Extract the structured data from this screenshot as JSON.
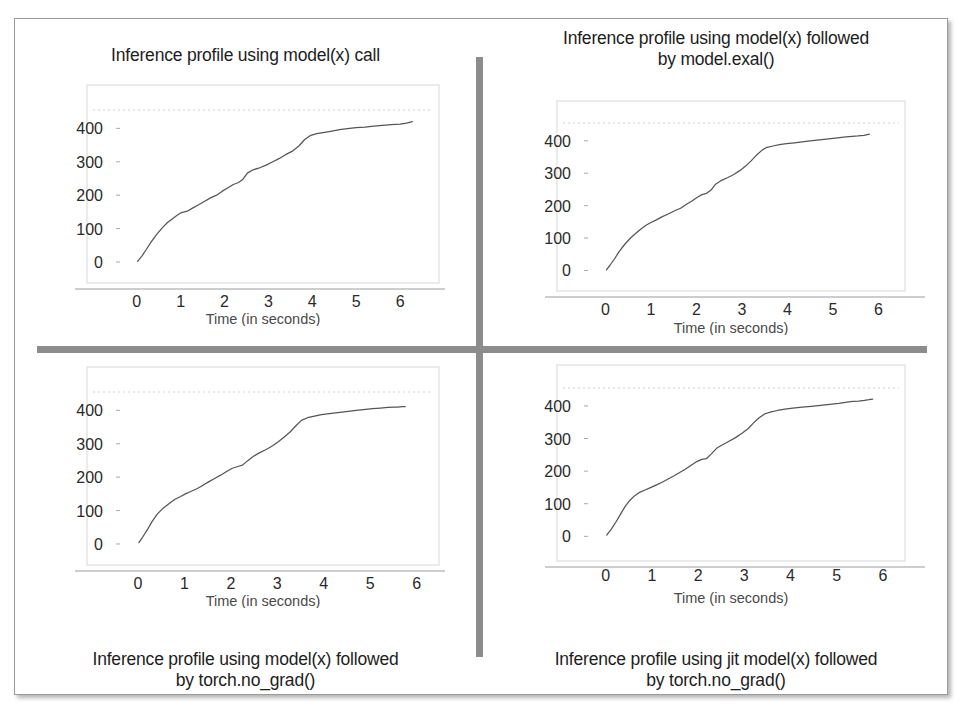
{
  "figure": {
    "layout": "2x2 grid of line charts separated by gray divider bars",
    "divider_color": "#8c8c8c",
    "frame_border_color": "#9a9a9a",
    "background_color": "#ffffff"
  },
  "charts": [
    {
      "position": "top-left",
      "title": "Inference profile using model(x) call",
      "title_position": "above",
      "chart_data": {
        "type": "line",
        "title": "Inference profile using model(x) call",
        "xlabel": "Time (in seconds)",
        "ylabel": "",
        "xlim": [
          -0.45,
          6.75
        ],
        "ylim": [
          -45,
          455
        ],
        "xticks": [
          0,
          1,
          2,
          3,
          4,
          5,
          6
        ],
        "yticks": [
          0,
          100,
          200,
          300,
          400
        ],
        "grid": false,
        "dotted_reference_line_y": 412,
        "legend": "none",
        "x": [
          0.02,
          0.12,
          0.22,
          0.33,
          0.45,
          0.58,
          0.7,
          0.8,
          0.92,
          1.02,
          1.15,
          1.28,
          1.42,
          1.55,
          1.68,
          1.82,
          1.95,
          2.08,
          2.2,
          2.32,
          2.42,
          2.52,
          2.65,
          2.8,
          2.95,
          3.1,
          3.25,
          3.4,
          3.55,
          3.7,
          3.82,
          3.95,
          4.1,
          4.28,
          4.45,
          4.62,
          4.8,
          5.0,
          5.2,
          5.4,
          5.6,
          5.8,
          6.0,
          6.15,
          6.28
        ],
        "y": [
          2,
          18,
          38,
          60,
          82,
          102,
          118,
          128,
          140,
          148,
          152,
          162,
          172,
          182,
          192,
          200,
          212,
          222,
          232,
          238,
          248,
          266,
          276,
          282,
          290,
          300,
          310,
          322,
          332,
          348,
          366,
          378,
          384,
          388,
          392,
          396,
          399,
          402,
          404,
          407,
          409,
          411,
          413,
          416,
          420
        ]
      }
    },
    {
      "position": "top-right",
      "title": "Inference profile using model(x) followed\nby model.exal()",
      "title_position": "above",
      "chart_data": {
        "type": "line",
        "title": "Inference profile using model(x) followed by model.exal()",
        "xlabel": "Time (in seconds)",
        "ylabel": "",
        "xlim": [
          -0.45,
          6.45
        ],
        "ylim": [
          -45,
          455
        ],
        "xticks": [
          0,
          1,
          2,
          3,
          4,
          5,
          6
        ],
        "yticks": [
          0,
          100,
          200,
          300,
          400
        ],
        "grid": false,
        "dotted_reference_line_y": 412,
        "legend": "none",
        "x": [
          0.02,
          0.1,
          0.2,
          0.3,
          0.42,
          0.55,
          0.68,
          0.78,
          0.9,
          1.0,
          1.12,
          1.25,
          1.38,
          1.52,
          1.65,
          1.78,
          1.9,
          2.02,
          2.12,
          2.22,
          2.32,
          2.42,
          2.55,
          2.68,
          2.82,
          2.95,
          3.08,
          3.2,
          3.32,
          3.45,
          3.55,
          3.68,
          3.82,
          3.98,
          4.15,
          4.32,
          4.5,
          4.7,
          4.9,
          5.1,
          5.28,
          5.42,
          5.55,
          5.68,
          5.8
        ],
        "y": [
          2,
          16,
          36,
          58,
          80,
          100,
          116,
          128,
          140,
          148,
          156,
          166,
          174,
          184,
          192,
          204,
          214,
          226,
          234,
          238,
          248,
          266,
          278,
          286,
          296,
          308,
          322,
          338,
          356,
          372,
          380,
          384,
          388,
          391,
          394,
          397,
          400,
          403,
          406,
          409,
          412,
          414,
          415,
          417,
          421
        ]
      }
    },
    {
      "position": "bottom-left",
      "title": "Inference profile using model(x) followed\nby torch.no_grad()",
      "title_position": "below",
      "chart_data": {
        "type": "line",
        "title": "Inference profile using model(x) followed by torch.no_grad()",
        "xlabel": "Time (in seconds)",
        "ylabel": "",
        "xlim": [
          -0.45,
          6.35
        ],
        "ylim": [
          -45,
          455
        ],
        "xticks": [
          0,
          1,
          2,
          3,
          4,
          5,
          6
        ],
        "yticks": [
          0,
          100,
          200,
          300,
          400
        ],
        "grid": false,
        "dotted_reference_line_y": 412,
        "legend": "none",
        "x": [
          0.02,
          0.1,
          0.2,
          0.3,
          0.42,
          0.55,
          0.68,
          0.8,
          0.92,
          1.02,
          1.15,
          1.28,
          1.4,
          1.52,
          1.65,
          1.78,
          1.9,
          2.02,
          2.15,
          2.25,
          2.35,
          2.48,
          2.6,
          2.75,
          2.9,
          3.02,
          3.15,
          3.28,
          3.4,
          3.52,
          3.65,
          3.8,
          3.95,
          4.12,
          4.3,
          4.48,
          4.65,
          4.85,
          5.05,
          5.22,
          5.38,
          5.5,
          5.6,
          5.68,
          5.75
        ],
        "y": [
          4,
          20,
          42,
          66,
          90,
          108,
          122,
          134,
          142,
          150,
          158,
          166,
          176,
          186,
          196,
          206,
          216,
          226,
          232,
          236,
          248,
          262,
          272,
          282,
          294,
          306,
          320,
          336,
          354,
          370,
          378,
          383,
          387,
          390,
          393,
          396,
          399,
          402,
          405,
          407,
          409,
          410,
          410,
          411,
          411
        ]
      }
    },
    {
      "position": "bottom-right",
      "title": "Inference profile using jit model(x) followed\nby torch.no_grad()",
      "title_position": "below",
      "chart_data": {
        "type": "line",
        "title": "Inference profile using jit model(x) followed by torch.no_grad()",
        "xlabel": "Time (in seconds)",
        "ylabel": "",
        "xlim": [
          -0.45,
          6.35
        ],
        "ylim": [
          -45,
          455
        ],
        "xticks": [
          0,
          1,
          2,
          3,
          4,
          5,
          6
        ],
        "yticks": [
          0,
          100,
          200,
          300,
          400
        ],
        "grid": false,
        "dotted_reference_line_y": 412,
        "legend": "none",
        "x": [
          0.02,
          0.12,
          0.22,
          0.32,
          0.42,
          0.52,
          0.62,
          0.72,
          0.85,
          0.98,
          1.1,
          1.22,
          1.35,
          1.48,
          1.6,
          1.72,
          1.85,
          1.98,
          2.08,
          2.18,
          2.28,
          2.4,
          2.52,
          2.65,
          2.8,
          2.95,
          3.08,
          3.2,
          3.32,
          3.45,
          3.58,
          3.72,
          3.88,
          4.05,
          4.25,
          4.45,
          4.65,
          4.85,
          5.05,
          5.22,
          5.35,
          5.48,
          5.6,
          5.7,
          5.78
        ],
        "y": [
          4,
          22,
          44,
          68,
          92,
          110,
          124,
          134,
          142,
          150,
          158,
          166,
          176,
          186,
          196,
          206,
          218,
          230,
          236,
          238,
          252,
          270,
          280,
          290,
          302,
          316,
          330,
          348,
          364,
          376,
          382,
          386,
          390,
          393,
          396,
          399,
          402,
          405,
          408,
          412,
          414,
          415,
          417,
          419,
          421
        ]
      }
    }
  ]
}
